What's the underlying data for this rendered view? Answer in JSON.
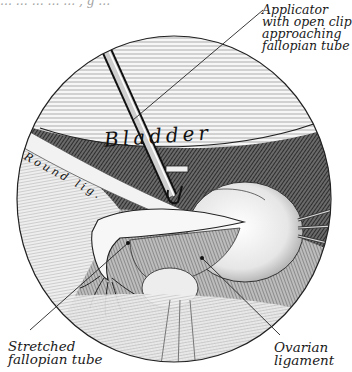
{
  "figure": {
    "type": "surgical-illustration",
    "view": "laparoscopic circular field of view",
    "top_fragment": "… … … … … , g …",
    "organ_labels": {
      "bladder": "Bladder",
      "round_ligament": "Round lig."
    },
    "callouts": {
      "applicator": [
        "Applicator",
        "with open clip",
        "approaching",
        "fallopian tube"
      ],
      "stretched_tube": [
        "Stretched",
        "fallopian tube"
      ],
      "ovarian_ligament": [
        "Ovarian",
        "ligament"
      ]
    },
    "colors": {
      "ink": "#111111",
      "paper": "#ffffff",
      "mid_gray": "#8a8a8a",
      "light_gray": "#d9d9d9",
      "dark_hatch": "#3a3a3a"
    }
  }
}
